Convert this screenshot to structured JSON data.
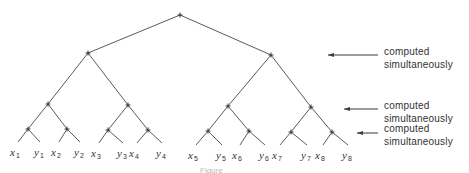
{
  "diagram": {
    "line_color": "#5a5a5a",
    "text_color": "#333333",
    "nodes": {
      "root": {
        "x": 180,
        "y": 15
      },
      "level1": [
        {
          "x": 88,
          "y": 53
        },
        {
          "x": 271,
          "y": 55
        }
      ],
      "level2": [
        {
          "x": 48,
          "y": 104
        },
        {
          "x": 128,
          "y": 105
        },
        {
          "x": 228,
          "y": 106
        },
        {
          "x": 311,
          "y": 107
        }
      ],
      "level3": [
        {
          "x": 28,
          "y": 129
        },
        {
          "x": 67,
          "y": 129
        },
        {
          "x": 108,
          "y": 130
        },
        {
          "x": 148,
          "y": 130
        },
        {
          "x": 208,
          "y": 131
        },
        {
          "x": 249,
          "y": 131
        },
        {
          "x": 291,
          "y": 132
        },
        {
          "x": 332,
          "y": 132
        }
      ]
    },
    "leaves": [
      {
        "var": "x",
        "sub": "1",
        "x": 14,
        "y": 152
      },
      {
        "var": "y",
        "sub": "1",
        "x": 38,
        "y": 152
      },
      {
        "var": "x",
        "sub": "2",
        "x": 55,
        "y": 152
      },
      {
        "var": "y",
        "sub": "2",
        "x": 78,
        "y": 152
      },
      {
        "var": "x",
        "sub": "3",
        "x": 95,
        "y": 153
      },
      {
        "var": "y",
        "sub": "3",
        "x": 121,
        "y": 153
      },
      {
        "var": "x",
        "sub": "4",
        "x": 133,
        "y": 153
      },
      {
        "var": "y",
        "sub": "4",
        "x": 160,
        "y": 153
      },
      {
        "var": "x",
        "sub": "5",
        "x": 192,
        "y": 155
      },
      {
        "var": "y",
        "sub": "5",
        "x": 220,
        "y": 155
      },
      {
        "var": "x",
        "sub": "6",
        "x": 236,
        "y": 155
      },
      {
        "var": "y",
        "sub": "6",
        "x": 263,
        "y": 155
      },
      {
        "var": "x",
        "sub": "7",
        "x": 276,
        "y": 155
      },
      {
        "var": "y",
        "sub": "7",
        "x": 305,
        "y": 155
      },
      {
        "var": "x",
        "sub": "8",
        "x": 319,
        "y": 155
      },
      {
        "var": "y",
        "sub": "8",
        "x": 346,
        "y": 155
      }
    ],
    "annotations": [
      {
        "line1": "computed",
        "line2": "simultaneously",
        "arrow_y": 55,
        "arrow_x1": 328,
        "arrow_x2": 378,
        "text_top": 45
      },
      {
        "line1": "computed",
        "line2": "simultaneously",
        "arrow_y": 109,
        "arrow_x1": 344,
        "arrow_x2": 378,
        "text_top": 99
      },
      {
        "line1": "computed",
        "line2": "simultaneously",
        "arrow_y": 133,
        "arrow_x1": 357,
        "arrow_x2": 378,
        "text_top": 122
      }
    ],
    "caption": "Figure"
  }
}
